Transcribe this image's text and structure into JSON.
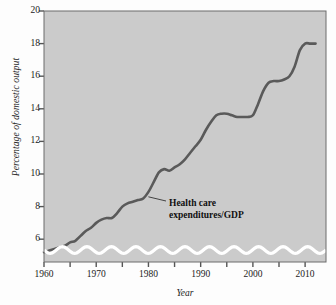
{
  "chart_data": {
    "type": "line",
    "title": "",
    "xlabel": "Year",
    "ylabel": "Percentage of domestic output",
    "xlim": [
      1960,
      2014
    ],
    "ylim": [
      4.6,
      20
    ],
    "grid": false,
    "legend": "none",
    "axis_break": true,
    "yticks": [
      6,
      8,
      10,
      12,
      14,
      16,
      18,
      20
    ],
    "xticks": [
      1960,
      1970,
      1980,
      1990,
      2000,
      2010
    ],
    "xticks_minor": [
      1965,
      1975,
      1985,
      1995,
      2005
    ],
    "annotations": [
      {
        "name": "series-label",
        "line1": "Health care",
        "line2": "expenditures/GDP",
        "points_to_year": 1980,
        "points_to_value": 8.6
      }
    ],
    "series": [
      {
        "name": "Health care expenditures/GDP",
        "color": "#5a5a5a",
        "x": [
          1960,
          1961,
          1962,
          1963,
          1964,
          1965,
          1966,
          1967,
          1968,
          1969,
          1970,
          1971,
          1972,
          1973,
          1974,
          1975,
          1976,
          1977,
          1978,
          1979,
          1980,
          1981,
          1982,
          1983,
          1984,
          1985,
          1986,
          1987,
          1988,
          1989,
          1990,
          1991,
          1992,
          1993,
          1994,
          1995,
          1996,
          1997,
          1998,
          1999,
          2000,
          2001,
          2002,
          2003,
          2004,
          2005,
          2006,
          2007,
          2008,
          2009,
          2010,
          2011,
          2012
        ],
        "values": [
          5.2,
          5.3,
          5.4,
          5.5,
          5.6,
          5.8,
          5.9,
          6.2,
          6.5,
          6.7,
          7.0,
          7.2,
          7.3,
          7.3,
          7.6,
          8.0,
          8.2,
          8.3,
          8.4,
          8.5,
          8.9,
          9.5,
          10.1,
          10.3,
          10.2,
          10.4,
          10.6,
          10.9,
          11.3,
          11.7,
          12.1,
          12.7,
          13.2,
          13.6,
          13.7,
          13.7,
          13.6,
          13.5,
          13.5,
          13.5,
          13.6,
          14.3,
          15.1,
          15.6,
          15.7,
          15.7,
          15.8,
          16.0,
          16.6,
          17.6,
          18.0,
          18.0,
          18.0
        ]
      }
    ]
  },
  "style": {
    "plot_background": "#cbcbcb",
    "line_color": "#5a5a5a",
    "axis_color": "#555555",
    "break_band_color": "#ffffff",
    "text_color": "#1b1b1b"
  }
}
